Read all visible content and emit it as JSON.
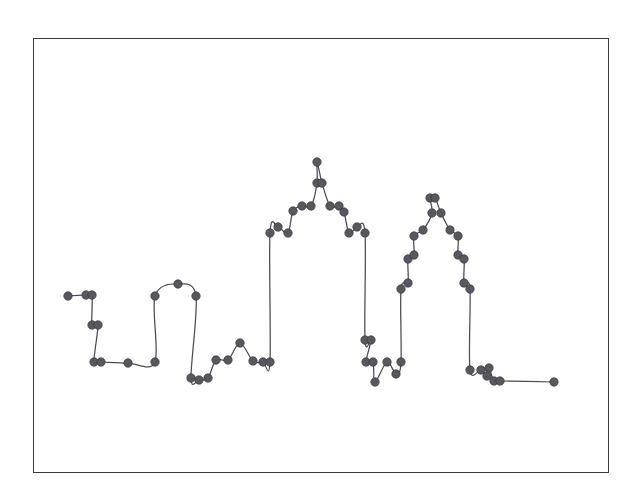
{
  "figure": {
    "background_color": "#ffffff",
    "frame": {
      "x": 33,
      "y": 38,
      "width": 576,
      "height": 435,
      "border_color": "#3a3a3e",
      "border_width": 1.4
    }
  },
  "chart_data": {
    "type": "line",
    "title": "",
    "subtitle": "",
    "xlabel": "",
    "ylabel": "",
    "grid": false,
    "legend": null,
    "legend_position": "none",
    "annotations": [],
    "xtick_labels": [],
    "ytick_labels": [],
    "axes_visible": false,
    "marker": {
      "shape": "circle",
      "radius_px": 4.2,
      "fill_color": "#58585e",
      "edge_color": "#35353a"
    },
    "line": {
      "color": "#4a4a50",
      "width_px": 1.25,
      "style": "solid",
      "interpolation": "smooth"
    },
    "xlim": [
      33,
      609
    ],
    "ylim": [
      473,
      38
    ],
    "series": [
      {
        "name": "profile",
        "points": [
          [
            68,
            296
          ],
          [
            86,
            295
          ],
          [
            92,
            295
          ],
          [
            92,
            325
          ],
          [
            98,
            325
          ],
          [
            94,
            362
          ],
          [
            101,
            362
          ],
          [
            128,
            363
          ],
          [
            155,
            362
          ],
          [
            155,
            296
          ],
          [
            178,
            284
          ],
          [
            196,
            296
          ],
          [
            191,
            378
          ],
          [
            199,
            380
          ],
          [
            208,
            378
          ],
          [
            216,
            360
          ],
          [
            228,
            360
          ],
          [
            240,
            343
          ],
          [
            253,
            361
          ],
          [
            263,
            362
          ],
          [
            270,
            362
          ],
          [
            270,
            233
          ],
          [
            278,
            227
          ],
          [
            288,
            233
          ],
          [
            293,
            211
          ],
          [
            302,
            206
          ],
          [
            311,
            206
          ],
          [
            317,
            183
          ],
          [
            317,
            162
          ],
          [
            322,
            183
          ],
          [
            330,
            206
          ],
          [
            339,
            206
          ],
          [
            344,
            212
          ],
          [
            349,
            233
          ],
          [
            357,
            227
          ],
          [
            365,
            233
          ],
          [
            365,
            340
          ],
          [
            371,
            340
          ],
          [
            366,
            362
          ],
          [
            373,
            362
          ],
          [
            375,
            382
          ],
          [
            387,
            362
          ],
          [
            396,
            374
          ],
          [
            401,
            362
          ],
          [
            401,
            289
          ],
          [
            408,
            283
          ],
          [
            408,
            259
          ],
          [
            414,
            255
          ],
          [
            414,
            236
          ],
          [
            423,
            230
          ],
          [
            432,
            213
          ],
          [
            430,
            198
          ],
          [
            435,
            198
          ],
          [
            441,
            213
          ],
          [
            450,
            230
          ],
          [
            458,
            236
          ],
          [
            458,
            255
          ],
          [
            464,
            259
          ],
          [
            464,
            283
          ],
          [
            470,
            289
          ],
          [
            470,
            370
          ],
          [
            481,
            370
          ],
          [
            487,
            376
          ],
          [
            489,
            368
          ],
          [
            494,
            381
          ],
          [
            500,
            381
          ],
          [
            554,
            382
          ]
        ]
      }
    ]
  }
}
